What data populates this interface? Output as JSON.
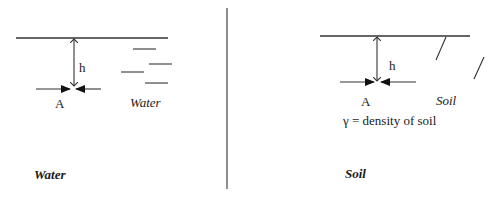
{
  "colors": {
    "background": "#ffffff",
    "line": "#333333",
    "text": "#1a1a1a"
  },
  "water_panel": {
    "depth_label": "h",
    "point_label": "A",
    "medium_label": "Water",
    "caption": "Water",
    "icons": {
      "surface": "water-surface-line",
      "depth_arrow": "double-arrow-vertical",
      "point_arrows": "converging-horizontal-arrows",
      "hatching": "water-dash-marks"
    }
  },
  "soil_panel": {
    "depth_label": "h",
    "point_label": "A",
    "medium_label": "Soil",
    "density_note": "γ = density of soil",
    "caption": "Soil",
    "icons": {
      "surface": "ground-surface-line",
      "depth_arrow": "double-arrow-vertical",
      "point_arrows": "converging-horizontal-arrows",
      "hatching": "soil-slash-marks"
    }
  }
}
